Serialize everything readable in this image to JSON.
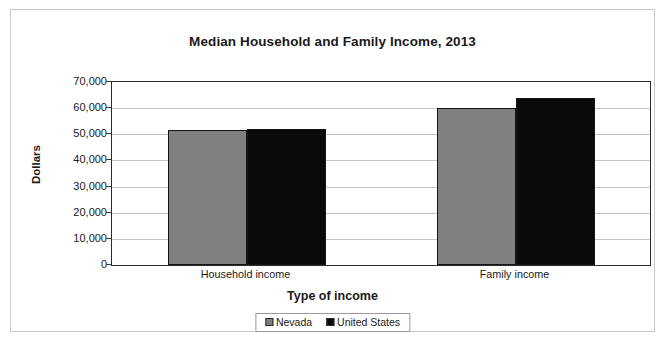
{
  "chart_data": {
    "type": "bar",
    "title": "Median Household and Family Income, 2013",
    "xlabel": "Type of income",
    "ylabel": "Dollars",
    "categories": [
      "Household income",
      "Family income"
    ],
    "series": [
      {
        "name": "Nevada",
        "color": "#808080",
        "values": [
          51600,
          59900
        ]
      },
      {
        "name": "United States",
        "color": "#0a0a0a",
        "values": [
          52200,
          63800
        ]
      }
    ],
    "ylim": [
      0,
      70000
    ],
    "ytick_values": [
      70000,
      60000,
      50000,
      40000,
      30000,
      20000,
      10000,
      0
    ],
    "ytick_labels": [
      "70,000",
      "60,000",
      "50,000",
      "40,000",
      "30,000",
      "20,000",
      "10,000",
      "0"
    ],
    "grid": true,
    "legend_position": "bottom"
  },
  "legend": {
    "entries": [
      {
        "label": "Nevada",
        "swatch": "gray-square-icon"
      },
      {
        "label": "United States",
        "swatch": "black-square-icon"
      }
    ]
  }
}
